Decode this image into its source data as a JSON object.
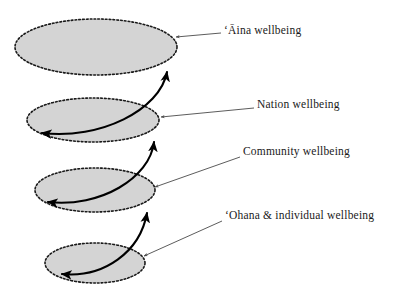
{
  "figure": {
    "background_color": "#ffffff",
    "ellipse_fill": "#d4d4d4",
    "ellipse_stroke": "#1a1a1a",
    "arrow_color": "#000000",
    "pointer_color": "#555555",
    "text_color": "#1a1a1a"
  },
  "labels": {
    "aina": "ʻĀina wellbeing",
    "nation": "Nation wellbeing",
    "community": "Community wellbeing",
    "ohana": "ʻOhana & individual wellbeing"
  },
  "levels": [
    {
      "id": "aina",
      "label": "ʻĀina wellbeing",
      "order": 1,
      "position": "top",
      "ellipse": {
        "cx": 96,
        "cy": 47,
        "rx": 81,
        "ry": 28
      }
    },
    {
      "id": "nation",
      "label": "Nation wellbeing",
      "order": 2,
      "position": "second",
      "ellipse": {
        "cx": 93,
        "cy": 120,
        "rx": 66,
        "ry": 22
      }
    },
    {
      "id": "community",
      "label": "Community wellbeing",
      "order": 3,
      "position": "third",
      "ellipse": {
        "cx": 95,
        "cy": 190,
        "rx": 60,
        "ry": 22
      }
    },
    {
      "id": "ohana",
      "label": "ʻOhana & individual wellbeing",
      "order": 4,
      "position": "bottom",
      "ellipse": {
        "cx": 95,
        "cy": 263,
        "rx": 50,
        "ry": 20
      }
    }
  ],
  "connectors": [
    {
      "id": "ohana-to-community",
      "from": "ohana",
      "to": "community",
      "style": "curved-spiral",
      "double_ended": true
    },
    {
      "id": "community-to-nation",
      "from": "community",
      "to": "nation",
      "style": "curved-spiral",
      "double_ended": true
    },
    {
      "id": "nation-to-aina",
      "from": "nation",
      "to": "aina",
      "style": "curved-spiral",
      "double_ended": true
    }
  ],
  "pointers": [
    {
      "id": "pointer-aina",
      "target": "aina",
      "direction": "horizontal-left"
    },
    {
      "id": "pointer-nation",
      "target": "nation",
      "direction": "horizontal-left"
    },
    {
      "id": "pointer-community",
      "target": "community",
      "direction": "diagonal-down-left"
    },
    {
      "id": "pointer-ohana",
      "target": "ohana",
      "direction": "diagonal-down-left"
    }
  ]
}
